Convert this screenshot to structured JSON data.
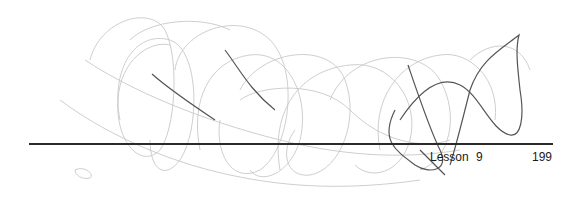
{
  "footer": {
    "lesson_label": "Lesson 9",
    "page_number": "199"
  },
  "decoration": {
    "icon": "scribble-line-art",
    "light_stroke": "#c8c8c8",
    "dark_stroke": "#555555"
  },
  "colors": {
    "rule": "#2a2a2a",
    "text": "#1a1a1a"
  }
}
